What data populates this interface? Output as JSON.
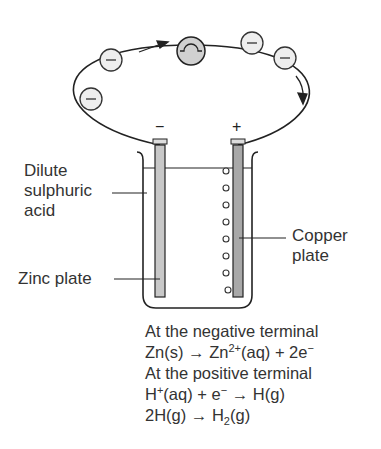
{
  "labels": {
    "acid": [
      "Dilute",
      "sulphuric",
      "acid"
    ],
    "zinc": "Zinc plate",
    "copper": [
      "Copper",
      "plate"
    ],
    "negative_sign": "−",
    "positive_sign": "+"
  },
  "equations": [
    {
      "text": "At the negative terminal"
    },
    {
      "parts": [
        "Zn(s) → Zn",
        "2+",
        "(aq) + 2e",
        "−"
      ]
    },
    {
      "text": "At the positive terminal"
    },
    {
      "parts": [
        "H",
        "+",
        "(aq) + e",
        "−",
        " → H(g)"
      ]
    },
    {
      "parts": [
        "2H(g) → H",
        "2",
        "(g)"
      ]
    }
  ],
  "electron_symbol": "−",
  "colors": {
    "line": "#222222",
    "zinc": "#c8c8c8",
    "copper": "#a8a8a8",
    "bulb": "#d0d0d0"
  }
}
